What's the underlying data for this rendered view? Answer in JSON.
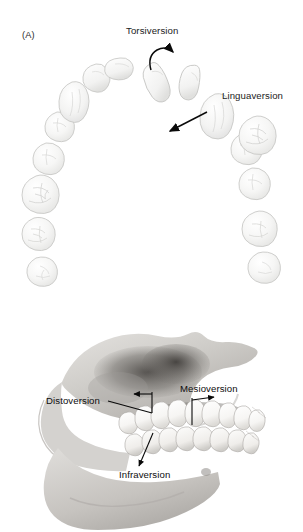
{
  "figure": {
    "panels": [
      {
        "tag": "(A)",
        "view": "occlusal view of maxillary dental arch",
        "labels": [
          {
            "text": "Torsiversion",
            "marker": "curved-rotation-arrow"
          },
          {
            "text": "Linguaversion",
            "marker": "straight-arrow-lingual"
          }
        ]
      },
      {
        "tag": "",
        "view": "lateral view of skull with teeth in occlusion",
        "labels": [
          {
            "text": "Distoversion",
            "marker": "leader-line-arrow-left"
          },
          {
            "text": "Mesioversion",
            "marker": "leader-line-arrow-right"
          },
          {
            "text": "Infraversion",
            "marker": "leader-line-arrow-down"
          }
        ]
      }
    ]
  },
  "panelA": {
    "tag": "(A)",
    "torsiversion_label": "Torsiversion",
    "linguaversion_label": "Linguaversion"
  },
  "panelB": {
    "distoversion_label": "Distoversion",
    "mesioversion_label": "Mesioversion",
    "infraversion_label": "Infraversion"
  },
  "colors": {
    "background": "#ffffff",
    "text": "#1b1b1b",
    "tooth_fill": "#f4f4f3",
    "tooth_fill_light": "#fafafa",
    "tooth_stroke": "#c9c9c7",
    "tooth_shade": "#e3e3e1",
    "bone_light": "#d8d6d3",
    "bone_mid": "#b9b6b2",
    "bone_dark": "#8e8b87",
    "bone_shadow": "#5d5a57",
    "arrow": "#0a0a0a",
    "skull_tooth": "#fdfdfc"
  }
}
